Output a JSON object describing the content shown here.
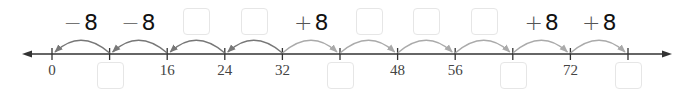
{
  "number_line": {
    "start": 0,
    "step": 8,
    "ticks": [
      0,
      8,
      16,
      24,
      32,
      40,
      48,
      56,
      64,
      72,
      80
    ],
    "origin_x": 52,
    "spacing": 57.6,
    "line_y": 54,
    "line_color": "#333333",
    "arrow_left_x": 22,
    "arrow_right_x": 672
  },
  "tick_labels": [
    {
      "value": 0,
      "text": "0"
    },
    {
      "value": 16,
      "text": "16"
    },
    {
      "value": 24,
      "text": "24"
    },
    {
      "value": 32,
      "text": "32"
    },
    {
      "value": 48,
      "text": "48"
    },
    {
      "value": 56,
      "text": "56"
    },
    {
      "value": 72,
      "text": "72"
    }
  ],
  "blank_tick_boxes": [
    8,
    40,
    64,
    80
  ],
  "jumps": [
    {
      "from": 8,
      "to": 0,
      "direction": "backward",
      "color": "#777777"
    },
    {
      "from": 16,
      "to": 8,
      "direction": "backward",
      "color": "#777777"
    },
    {
      "from": 24,
      "to": 16,
      "direction": "backward",
      "color": "#777777"
    },
    {
      "from": 32,
      "to": 24,
      "direction": "backward",
      "color": "#777777"
    },
    {
      "from": 32,
      "to": 40,
      "direction": "forward",
      "color": "#aaaaaa"
    },
    {
      "from": 40,
      "to": 48,
      "direction": "forward",
      "color": "#aaaaaa"
    },
    {
      "from": 48,
      "to": 56,
      "direction": "forward",
      "color": "#aaaaaa"
    },
    {
      "from": 56,
      "to": 64,
      "direction": "forward",
      "color": "#aaaaaa"
    },
    {
      "from": 64,
      "to": 72,
      "direction": "forward",
      "color": "#aaaaaa"
    },
    {
      "from": 72,
      "to": 80,
      "direction": "forward",
      "color": "#aaaaaa"
    }
  ],
  "jump_labels": [
    {
      "segment": [
        0,
        8
      ],
      "sign": "−",
      "amount": "8"
    },
    {
      "segment": [
        8,
        16
      ],
      "sign": "−",
      "amount": "8"
    },
    {
      "segment": [
        32,
        40
      ],
      "sign": "+",
      "amount": "8"
    },
    {
      "segment": [
        64,
        72
      ],
      "sign": "+",
      "amount": "8"
    },
    {
      "segment": [
        72,
        80
      ],
      "sign": "+",
      "amount": "8"
    }
  ],
  "blank_jump_boxes": [
    [
      16,
      24
    ],
    [
      24,
      32
    ],
    [
      40,
      48
    ],
    [
      48,
      56
    ],
    [
      56,
      64
    ]
  ],
  "box_border_color": "#e6e6e6"
}
